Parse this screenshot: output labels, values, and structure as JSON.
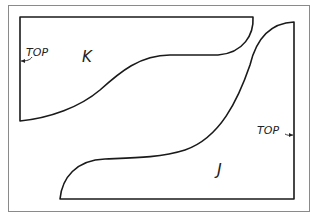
{
  "diagram": {
    "type": "cutting-layout",
    "pieces": [
      {
        "id": "K",
        "label": "K",
        "top_label": "TOP"
      },
      {
        "id": "J",
        "label": "J",
        "top_label": "TOP"
      }
    ]
  },
  "labels": {
    "piece_k": "K",
    "piece_j": "J",
    "top_k": "TOP",
    "top_j": "TOP"
  },
  "colors": {
    "outline": "#1a1a1a",
    "frame": "#8a8a8a",
    "background": "#ffffff"
  }
}
